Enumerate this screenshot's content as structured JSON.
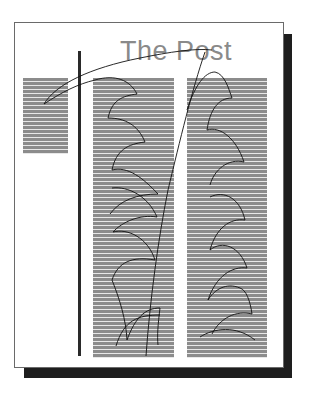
{
  "figure": {
    "title": "The Post",
    "colors": {
      "page_background": "#ffffff",
      "page_border": "#6a6a6a",
      "drop_shadow": "#1e1e1e",
      "title_text": "#8a8a8a",
      "text_lines": "#8c8c8c",
      "column_rule": "#2a2a2a",
      "reading_path": "#111111"
    },
    "columns": [
      {
        "id": "left-column",
        "role": "short text block"
      },
      {
        "id": "middle-column",
        "role": "long text column"
      },
      {
        "id": "right-column",
        "role": "long text column"
      }
    ],
    "reading_path": {
      "style": "scalloped arcs (fixations and regressions)"
    }
  }
}
